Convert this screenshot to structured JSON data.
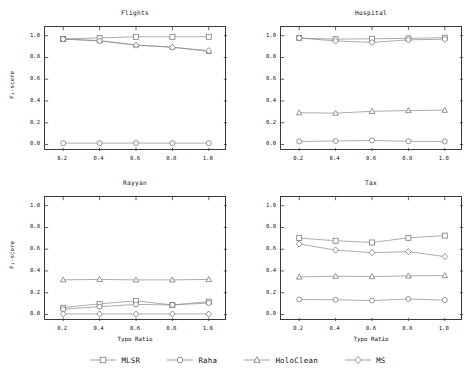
{
  "chart_data": [
    {
      "type": "line",
      "title": "Flights",
      "xlabel": "",
      "ylabel": "F₁-score",
      "x": [
        0.2,
        0.4,
        0.6,
        0.8,
        1.0
      ],
      "xlim": [
        0.1,
        1.1
      ],
      "ylim": [
        -0.06,
        1.08
      ],
      "xticks": [
        "0.2",
        "0.4",
        "0.6",
        "0.8",
        "1.0"
      ],
      "yticks": [
        "0.0",
        "0.2",
        "0.4",
        "0.6",
        "0.8",
        "1.0"
      ],
      "ytick_values": [
        0.0,
        0.2,
        0.4,
        0.6,
        0.8,
        1.0
      ],
      "grid": false,
      "series": [
        {
          "name": "MLSR",
          "marker": "square",
          "values": [
            0.97,
            0.98,
            0.99,
            0.99,
            0.99
          ]
        },
        {
          "name": "Raha",
          "marker": "circle",
          "values": [
            0.012,
            0.012,
            0.013,
            0.012,
            0.012
          ]
        },
        {
          "name": "HoloClean",
          "marker": "triangle",
          "values": [
            0.97,
            0.955,
            0.915,
            0.895,
            0.855
          ]
        },
        {
          "name": "MS",
          "marker": "diamond",
          "values": [
            0.968,
            0.952,
            0.913,
            0.893,
            0.862
          ]
        }
      ]
    },
    {
      "type": "line",
      "title": "Hospital",
      "xlabel": "",
      "ylabel": "",
      "x": [
        0.2,
        0.4,
        0.6,
        0.8,
        1.0
      ],
      "xlim": [
        0.1,
        1.1
      ],
      "ylim": [
        -0.06,
        1.08
      ],
      "xticks": [
        "0.2",
        "0.4",
        "0.6",
        "0.8",
        "1.0"
      ],
      "yticks": [
        "0.0",
        "0.2",
        "0.4",
        "0.6",
        "0.8",
        "1.0"
      ],
      "ytick_values": [
        0.0,
        0.2,
        0.4,
        0.6,
        0.8,
        1.0
      ],
      "grid": false,
      "series": [
        {
          "name": "MLSR",
          "marker": "square",
          "values": [
            0.978,
            0.968,
            0.972,
            0.975,
            0.982
          ]
        },
        {
          "name": "Raha",
          "marker": "circle",
          "values": [
            0.028,
            0.032,
            0.037,
            0.029,
            0.028
          ]
        },
        {
          "name": "HoloClean",
          "marker": "triangle",
          "values": [
            0.292,
            0.288,
            0.305,
            0.312,
            0.315
          ]
        },
        {
          "name": "MS",
          "marker": "diamond",
          "values": [
            0.978,
            0.952,
            0.938,
            0.962,
            0.968
          ]
        }
      ]
    },
    {
      "type": "line",
      "title": "Rayyan",
      "xlabel": "Typo Ratio",
      "ylabel": "F₁-score",
      "x": [
        0.2,
        0.4,
        0.6,
        0.8,
        1.0
      ],
      "xlim": [
        0.1,
        1.1
      ],
      "ylim": [
        -0.06,
        1.08
      ],
      "xticks": [
        "0.2",
        "0.4",
        "0.6",
        "0.8",
        "1.0"
      ],
      "yticks": [
        "0.0",
        "0.2",
        "0.4",
        "0.6",
        "0.8",
        "1.0"
      ],
      "ytick_values": [
        0.0,
        0.2,
        0.4,
        0.6,
        0.8,
        1.0
      ],
      "grid": false,
      "series": [
        {
          "name": "MLSR",
          "marker": "square",
          "values": [
            0.062,
            0.098,
            0.125,
            0.088,
            0.118
          ]
        },
        {
          "name": "Raha",
          "marker": "circle",
          "values": [
            0.048,
            0.072,
            0.092,
            0.088,
            0.105
          ]
        },
        {
          "name": "HoloClean",
          "marker": "triangle",
          "values": [
            0.318,
            0.322,
            0.318,
            0.318,
            0.322
          ]
        },
        {
          "name": "MS",
          "marker": "diamond",
          "values": [
            0.005,
            0.005,
            0.005,
            0.005,
            0.005
          ]
        }
      ]
    },
    {
      "type": "line",
      "title": "Tax",
      "xlabel": "Typo Ratio",
      "ylabel": "",
      "x": [
        0.2,
        0.4,
        0.6,
        0.8,
        1.0
      ],
      "xlim": [
        0.1,
        1.1
      ],
      "ylim": [
        -0.06,
        1.08
      ],
      "xticks": [
        "0.2",
        "0.4",
        "0.6",
        "0.8",
        "1.0"
      ],
      "yticks": [
        "0.0",
        "0.2",
        "0.4",
        "0.6",
        "0.8",
        "1.0"
      ],
      "ytick_values": [
        0.0,
        0.2,
        0.4,
        0.6,
        0.8,
        1.0
      ],
      "grid": false,
      "series": [
        {
          "name": "MLSR",
          "marker": "square",
          "values": [
            0.702,
            0.678,
            0.662,
            0.705,
            0.725
          ]
        },
        {
          "name": "Raha",
          "marker": "circle",
          "values": [
            0.138,
            0.135,
            0.128,
            0.142,
            0.132
          ]
        },
        {
          "name": "HoloClean",
          "marker": "triangle",
          "values": [
            0.345,
            0.352,
            0.348,
            0.355,
            0.358
          ]
        },
        {
          "name": "MS",
          "marker": "diamond",
          "values": [
            0.648,
            0.592,
            0.568,
            0.578,
            0.532
          ]
        }
      ]
    }
  ],
  "legend": {
    "position": "bottom-center",
    "items": [
      {
        "label": "MLSR",
        "marker": "square"
      },
      {
        "label": "Raha",
        "marker": "circle"
      },
      {
        "label": "HoloClean",
        "marker": "triangle"
      },
      {
        "label": "MS",
        "marker": "diamond"
      }
    ]
  },
  "style": {
    "line_color": "#8a8a8a",
    "marker_edge_color": "#7a7a7a",
    "marker_face_color": "#ffffff",
    "axis_color": "#3a3a3a",
    "text_color": "#111111",
    "background": "#ffffff"
  }
}
